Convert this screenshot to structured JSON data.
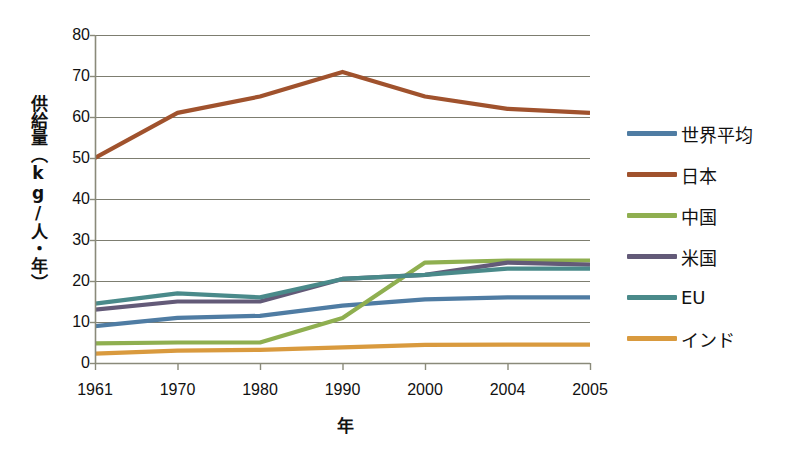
{
  "chart_data": {
    "type": "line",
    "title": "",
    "xlabel": "年",
    "ylabel": "供給量（kg/人・年）",
    "categories": [
      "1961",
      "1970",
      "1980",
      "1990",
      "2000",
      "2004",
      "2005"
    ],
    "ylim": [
      0,
      80
    ],
    "y_ticks": [
      0,
      10,
      20,
      30,
      40,
      50,
      60,
      70,
      80
    ],
    "grid": true,
    "legend_position": "right",
    "series": [
      {
        "name": "世界平均",
        "color": "#4F7CA3",
        "values": [
          9.0,
          11.0,
          11.5,
          14.0,
          15.5,
          16.0,
          16.0
        ]
      },
      {
        "name": "日本",
        "color": "#A0522D",
        "values": [
          50.0,
          61.0,
          65.0,
          71.0,
          65.0,
          62.0,
          61.0
        ]
      },
      {
        "name": "中国",
        "color": "#8FAF50",
        "values": [
          4.8,
          5.0,
          5.0,
          11.0,
          24.5,
          25.0,
          25.0
        ]
      },
      {
        "name": "米国",
        "color": "#635A78",
        "values": [
          13.0,
          15.0,
          15.0,
          20.5,
          21.5,
          24.5,
          24.0
        ]
      },
      {
        "name": "EU",
        "color": "#4A8A8A",
        "values": [
          14.5,
          17.0,
          16.0,
          20.5,
          21.5,
          23.0,
          23.0
        ]
      },
      {
        "name": "インド",
        "color": "#D99A3E",
        "values": [
          2.3,
          3.0,
          3.2,
          3.8,
          4.4,
          4.5,
          4.5
        ]
      }
    ]
  },
  "axis": {
    "y_tick_labels": [
      "80",
      "70",
      "60",
      "50",
      "40",
      "30",
      "20",
      "10",
      "0"
    ],
    "y_title": "供給量（kg/人・年）",
    "x_title": "年",
    "x_tick_labels": [
      "1961",
      "1970",
      "1980",
      "1990",
      "2000",
      "2004",
      "2005"
    ]
  },
  "legend": {
    "items": [
      {
        "label": "世界平均",
        "color": "#4F7CA3"
      },
      {
        "label": "日本",
        "color": "#A0522D"
      },
      {
        "label": "中国",
        "color": "#8FAF50"
      },
      {
        "label": "米国",
        "color": "#635A78"
      },
      {
        "label": "EU",
        "color": "#4A8A8A"
      },
      {
        "label": "インド",
        "color": "#D99A3E"
      }
    ]
  },
  "style": {
    "grid_color": "#7d7d70",
    "axis_color": "#8a8a7a",
    "background": "#ffffff"
  }
}
